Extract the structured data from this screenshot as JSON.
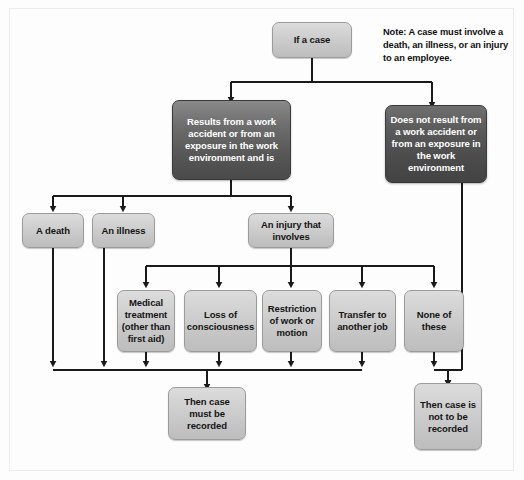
{
  "diagram": {
    "note": "Note: A case must involve a death, an illness, or an injury to an employee.",
    "colors": {
      "light_box": "#cfcfcf",
      "dark_box": "#565656",
      "light_border": "#9b9b9b",
      "dark_border": "#3a3a3a",
      "light_text": "#151515",
      "dark_text": "#ffffff",
      "connector": "#1a1a1a",
      "frame": "#ececec",
      "background": "#fdfdfd"
    },
    "nodes": {
      "start": "If a case",
      "branch_yes": "Results from a work accident or from an exposure in the work environment and is",
      "branch_no": "Does not result from a work accident or from an exposure in the work environment",
      "death": "A death",
      "illness": "An illness",
      "injury": "An injury that involves",
      "injury_medical": "Medical treatment (other than first aid)",
      "injury_loc": "Loss of consciousness",
      "injury_restriction": "Restriction of work or motion",
      "injury_transfer": "Transfer to another job",
      "injury_none": "None of these",
      "result_recorded": "Then case must be recorded",
      "result_not_recorded": "Then case is not to be recorded"
    }
  }
}
